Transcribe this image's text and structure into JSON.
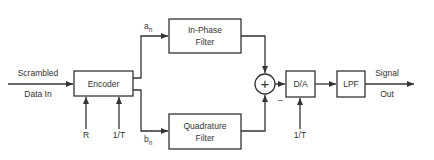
{
  "diagram": {
    "type": "block-diagram",
    "title": "",
    "input": {
      "line1": "Scrambled",
      "line2": "Data In"
    },
    "encoder": {
      "label": "Encoder",
      "inputs": [
        "R",
        "1/T"
      ]
    },
    "branches": {
      "upper": {
        "symbol": "a",
        "subscript": "n",
        "filter": {
          "line1": "In-Phase",
          "line2": "Filter"
        }
      },
      "lower": {
        "symbol": "b",
        "subscript": "n",
        "filter": {
          "line1": "Quadrature",
          "line2": "Filter"
        }
      }
    },
    "summer": {
      "symbol": "+",
      "minus_sign": "–"
    },
    "dac": {
      "label": "D/A",
      "clock": "1/T"
    },
    "lpf": {
      "label": "LPF"
    },
    "output": {
      "line1": "Signal",
      "line2": "Out"
    },
    "colors": {
      "stroke": "#333333",
      "background": "#ffffff"
    }
  }
}
